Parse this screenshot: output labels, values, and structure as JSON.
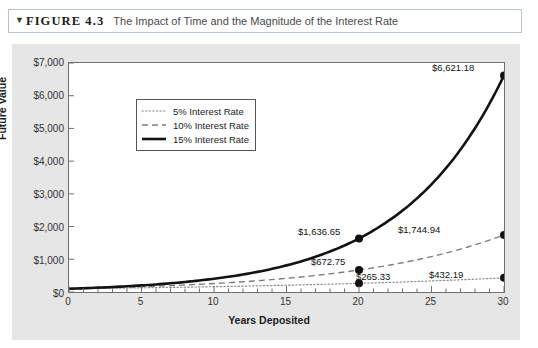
{
  "figure": {
    "marker_icon": "triangle-down-icon",
    "label": "FIGURE 4.3",
    "title": "The Impact of Time and the Magnitude of the Interest Rate"
  },
  "chart_data": {
    "type": "line",
    "title": "The Impact of Time and the Magnitude of the Interest Rate",
    "xlabel": "Years Deposited",
    "ylabel": "Future Value",
    "xlim": [
      0,
      30
    ],
    "ylim": [
      0,
      7000
    ],
    "x_ticks": [
      "0",
      "5",
      "10",
      "15",
      "20",
      "25",
      "30"
    ],
    "x_tick_values": [
      0,
      5,
      10,
      15,
      20,
      25,
      30
    ],
    "x_minor_step": 1,
    "y_ticks": [
      "$0",
      "$1,000",
      "$2,000",
      "$3,000",
      "$4,000",
      "$5,000",
      "$6,000",
      "$7,000"
    ],
    "y_tick_values": [
      0,
      1000,
      2000,
      3000,
      4000,
      5000,
      6000,
      7000
    ],
    "grid": false,
    "legend_position": "upper-left-inside",
    "principal": 100,
    "series": [
      {
        "name": "5% Interest Rate",
        "rate": 0.05,
        "style": "dotted",
        "color": "#888888",
        "x": [
          0,
          5,
          10,
          15,
          20,
          25,
          30
        ],
        "values": [
          100,
          127.63,
          162.89,
          207.89,
          265.33,
          338.64,
          432.19
        ]
      },
      {
        "name": "10% Interest Rate",
        "rate": 0.1,
        "style": "dashed",
        "color": "#7a7a7a",
        "x": [
          0,
          5,
          10,
          15,
          20,
          25,
          30
        ],
        "values": [
          100,
          161.05,
          259.37,
          417.72,
          672.75,
          1083.47,
          1744.94
        ]
      },
      {
        "name": "15% Interest Rate",
        "rate": 0.15,
        "style": "solid",
        "color": "#1a1a1a",
        "x": [
          0,
          5,
          10,
          15,
          20,
          25,
          30
        ],
        "values": [
          100,
          201.14,
          404.56,
          813.71,
          1636.65,
          3291.9,
          6621.18
        ]
      }
    ],
    "annotations": [
      {
        "text": "$1,636.65",
        "x": 20,
        "y": 1636.65,
        "series": "15% Interest Rate"
      },
      {
        "text": "$6,621.18",
        "x": 30,
        "y": 6621.18,
        "series": "15% Interest Rate"
      },
      {
        "text": "$672.75",
        "x": 20,
        "y": 672.75,
        "series": "10% Interest Rate"
      },
      {
        "text": "$1,744.94",
        "x": 30,
        "y": 1744.94,
        "series": "10% Interest Rate"
      },
      {
        "text": "$265.33",
        "x": 20,
        "y": 265.33,
        "series": "5% Interest Rate"
      },
      {
        "text": "$432.19",
        "x": 30,
        "y": 432.19,
        "series": "5% Interest Rate"
      }
    ]
  },
  "colors": {
    "panel_background": "#e6e6e6",
    "plot_background": "#ffffff",
    "axis": "#6f6f6f",
    "title_border": "#b9c3cf"
  },
  "y_labels": {
    "t0": "$0",
    "t1": "$1,000",
    "t2": "$2,000",
    "t3": "$3,000",
    "t4": "$4,000",
    "t5": "$5,000",
    "t6": "$6,000",
    "t7": "$7,000"
  },
  "x_labels": {
    "t0": "0",
    "t1": "5",
    "t2": "10",
    "t3": "15",
    "t4": "20",
    "t5": "25",
    "t6": "30"
  },
  "axis_titles": {
    "y": "Future Value",
    "x": "Years Deposited"
  },
  "legend": {
    "items": [
      {
        "label": "5% Interest Rate",
        "style": "dotted"
      },
      {
        "label": "10% Interest Rate",
        "style": "dashed"
      },
      {
        "label": "15% Interest Rate",
        "style": "solid"
      }
    ]
  },
  "data_labels": {
    "l_1636": "$1,636.65",
    "l_6621": "$6,621.18",
    "l_672": "$672.75",
    "l_1744": "$1,744.94",
    "l_265": "$265.33",
    "l_432": "$432.19"
  }
}
